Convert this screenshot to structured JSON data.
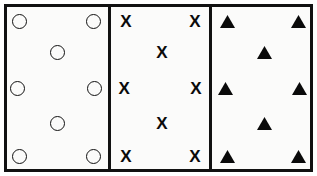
{
  "figure": {
    "width": 317,
    "height": 176,
    "background_color": "#ffffff",
    "panel_fill_color": "#fbfbfa",
    "stroke_color": "#111111",
    "border_width": 3
  },
  "layout": {
    "frame": {
      "x": 4,
      "y": 4,
      "width": 309,
      "height": 168
    },
    "dividers": [
      {
        "x": 108,
        "y": 4,
        "height": 168
      },
      {
        "x": 209,
        "y": 4,
        "height": 168
      }
    ]
  },
  "positions": [
    {
      "name": "top-left",
      "xpct": 13,
      "ypct": 9
    },
    {
      "name": "top-right",
      "xpct": 88,
      "ypct": 9
    },
    {
      "name": "upper-center",
      "xpct": 52,
      "ypct": 28
    },
    {
      "name": "middle-left",
      "xpct": 11,
      "ypct": 50
    },
    {
      "name": "middle-right",
      "xpct": 89,
      "ypct": 50
    },
    {
      "name": "lower-center",
      "xpct": 52,
      "ypct": 72
    },
    {
      "name": "bottom-left",
      "xpct": 13,
      "ypct": 92
    },
    {
      "name": "bottom-right",
      "xpct": 88,
      "ypct": 92
    }
  ],
  "panels": [
    {
      "id": "panel-circles",
      "symbol": "open-circle",
      "symbol_label": "",
      "count": 8,
      "fill": "none",
      "outline": "#111111",
      "x": 4,
      "width": 104
    },
    {
      "id": "panel-x-marks",
      "symbol": "x-mark",
      "symbol_label": "X",
      "count": 8,
      "fill": "#0a0a0a",
      "outline": "#0a0a0a",
      "x": 111,
      "width": 98
    },
    {
      "id": "panel-triangles",
      "symbol": "filled-triangle",
      "symbol_label": "",
      "count": 8,
      "fill": "#0a0a0a",
      "outline": "#0a0a0a",
      "x": 212,
      "width": 101
    }
  ]
}
